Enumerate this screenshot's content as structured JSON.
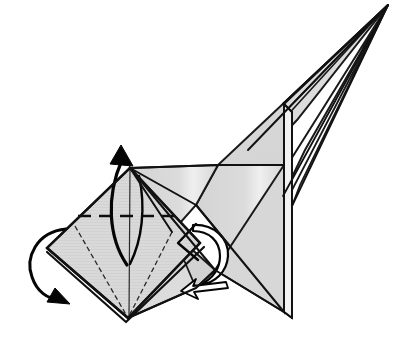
{
  "illustration": {
    "title": "Origami folding step diagram",
    "subject": "paper-crane-style model, partially folded",
    "background_color": "#ffffff",
    "paper_fill_color": "#d9d9d9",
    "paper_fill_shadow_color": "#c9c9c9",
    "paper_highlight_color": "#ebebeb",
    "line_color": "#111111",
    "arrow_color": "#050505",
    "canvas": {
      "width": 401,
      "height": 348
    }
  },
  "shapes": {
    "left_diamond": {
      "name": "left square flap diamond",
      "fill": "#d9d9d9",
      "top_vertex": "130,168",
      "left_vertex": "47,248",
      "bottom_vertex": "128,318",
      "right_vertex": "200,243"
    },
    "body_panel": {
      "name": "central body panel",
      "fill": "#d9d9d9"
    },
    "wing_panel": {
      "name": "upper right wing triangle",
      "fill": "#dcdcdc"
    },
    "spike": {
      "name": "long pointed neck spike",
      "tip": "388,5",
      "fill": "#dddddd"
    },
    "vertical_spine": {
      "name": "vertical folded spine edge",
      "x": 283,
      "y_top": 104,
      "y_bottom": 312
    }
  },
  "creases": {
    "valley_dashed": {
      "name": "horizontal dashed valley crease",
      "style": "dashed",
      "from": "78,216",
      "to": "176,216",
      "dash_pattern": "13 8"
    },
    "thin_creases": [
      {
        "name": "left inner crease",
        "from": "130,168",
        "to": "128,318"
      },
      {
        "name": "right inner crease",
        "from": "172,232",
        "to": "128,318"
      },
      {
        "name": "left diagonal crease",
        "from": "75,226",
        "to": "128,318"
      }
    ]
  },
  "arrows": [
    {
      "id": "arrow-fold-up",
      "name": "fold-up-arrow",
      "description": "curved arrow sweeping up past the top vertex pointing up-left",
      "direction": "up",
      "head_at": "121,146"
    },
    {
      "id": "arrow-flip-left",
      "name": "flip-over-arrow",
      "description": "curved turn-over arrow on the left side pointing down-right",
      "direction": "down-right",
      "head_at": "56,297"
    },
    {
      "id": "arrow-tuck-right",
      "name": "tuck-arrow",
      "description": "open outline arrow curving around the right of the flap",
      "direction": "curl"
    },
    {
      "id": "arrow-push-left",
      "name": "push-left-arrow",
      "description": "thin hollow arrow under the body pointing left",
      "direction": "left",
      "head_at": "182,292"
    }
  ]
}
